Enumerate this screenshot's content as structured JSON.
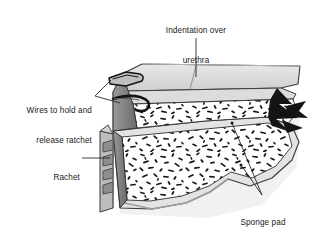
{
  "figure": {
    "kind": "medical-device-illustration",
    "style": "grayscale line art, cutaway cross-section"
  },
  "labels": {
    "indentation": {
      "text": "Indentation over\nurethra",
      "line1": "Indentation over",
      "line2": "urethra",
      "align": "center",
      "leader": "vertical line down to top surface seam"
    },
    "wires": {
      "text": "Wires to hold and\nrelease ratchet",
      "line1": "Wires to hold and",
      "line2": "release ratchet",
      "align": "right",
      "leader": "two lines to wire loops on upper slab"
    },
    "rachet": {
      "text": "Rachet",
      "align": "right",
      "leader": "horizontal line to toothed strip"
    },
    "sponge": {
      "text": "Sponge pad",
      "align": "center",
      "leader": "two lines to upper and lower sponge interiors"
    }
  },
  "colors": {
    "ink": "#1a1a1a",
    "outline": "#3a3a3a",
    "leader": "#2b2b2b",
    "top_face": "#d9d9d9",
    "top_face_light": "#e6e6e6",
    "side_face": "#8c8c8c",
    "side_face_dark": "#6e6e6e",
    "shadow": "#c9c9c9",
    "sponge_bg": "#ffffff",
    "sponge_fleck": "#171717",
    "clamp_black": "#141414",
    "page": "#ffffff"
  },
  "parts": [
    {
      "name": "upper-slab",
      "desc": "top arm with gray cap surface and sponge cutaway"
    },
    {
      "name": "lower-slab",
      "desc": "bottom arm with sponge cutaway and wavy contour"
    },
    {
      "name": "ratchet-strip",
      "desc": "vertical toothed bar at left of lower arm"
    },
    {
      "name": "wire-loops",
      "desc": "two wire loops at upper-left of top arm"
    },
    {
      "name": "clamp-hinge",
      "desc": "black arrow-shaped hinge at right end"
    },
    {
      "name": "top-seam",
      "desc": "indentation groove across top surface"
    }
  ]
}
